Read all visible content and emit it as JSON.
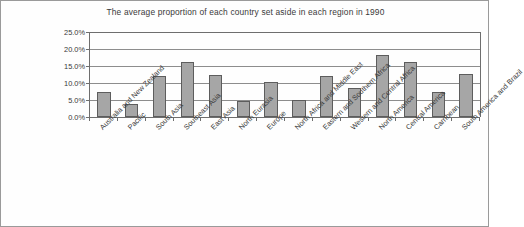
{
  "chart_data": {
    "type": "bar",
    "title": "The average proportion of each country set aside in each region in 1990",
    "xlabel": "",
    "ylabel": "",
    "ylim": [
      0,
      25
    ],
    "ytick_labels": [
      "0.0%",
      "5.0%",
      "10.0%",
      "15.0%",
      "20.0%",
      "25.0%"
    ],
    "ytick_values": [
      0,
      5,
      10,
      15,
      20,
      25
    ],
    "grid": true,
    "legend": "none",
    "units": "percent",
    "bar_color": "#a6a6a6",
    "bar_border_color": "#5d5d5d",
    "categories": [
      "Australia and New Zealand",
      "Pacific",
      "South Asia",
      "Southeast Asia",
      "East Asia",
      "North Eurasia",
      "Europe",
      "North Africa and Middle East",
      "Eastern and Southern Africa",
      "Western and Central Africa",
      "North America",
      "Central America",
      "Carribean",
      "South America and Brazil"
    ],
    "values": [
      7.4,
      3.8,
      12.0,
      16.3,
      12.3,
      4.7,
      10.2,
      5.1,
      12.2,
      8.5,
      18.3,
      16.3,
      7.5,
      12.7
    ]
  }
}
